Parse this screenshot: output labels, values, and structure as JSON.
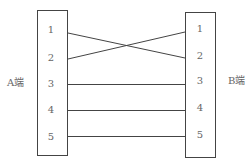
{
  "diagram": {
    "left_end": {
      "label": "A端",
      "pins": [
        "1",
        "2",
        "3",
        "4",
        "5"
      ]
    },
    "right_end": {
      "label": "B端",
      "pins": [
        "1",
        "2",
        "3",
        "4",
        "5"
      ]
    },
    "connections": [
      {
        "from": "A1",
        "to": "B2"
      },
      {
        "from": "A2",
        "to": "B1"
      },
      {
        "from": "A3",
        "to": "B3"
      },
      {
        "from": "A4",
        "to": "B4"
      },
      {
        "from": "A5",
        "to": "B5"
      }
    ],
    "colors": {
      "stroke": "#444444",
      "text": "#666666"
    }
  }
}
